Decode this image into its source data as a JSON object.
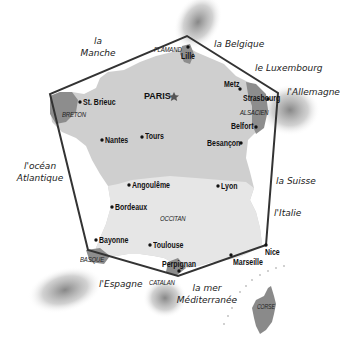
{
  "map": {
    "type": "schematic map of France (hexagon) with neighbors and regional languages",
    "colors": {
      "land": "#cfcfcf",
      "land_south": "#e4e4e4",
      "region_highlight": "#8a8a8a",
      "hexagon_line": "#333333",
      "background": "#ffffff"
    },
    "capital": {
      "name": "PARIS",
      "icon": "star-icon"
    },
    "cities": [
      {
        "name": "Lille"
      },
      {
        "name": "Metz"
      },
      {
        "name": "Strasbourg"
      },
      {
        "name": "St. Brieuc"
      },
      {
        "name": "Belfort"
      },
      {
        "name": "Nantes"
      },
      {
        "name": "Tours"
      },
      {
        "name": "Besançon"
      },
      {
        "name": "Angoulême"
      },
      {
        "name": "Lyon"
      },
      {
        "name": "Bordeaux"
      },
      {
        "name": "Bayonne"
      },
      {
        "name": "Toulouse"
      },
      {
        "name": "Perpignan"
      },
      {
        "name": "Marseille"
      },
      {
        "name": "Nice"
      }
    ],
    "regions": [
      {
        "name": "FLAMAND"
      },
      {
        "name": "BRETON"
      },
      {
        "name": "ALSACIEN"
      },
      {
        "name": "OCCITAN"
      },
      {
        "name": "BASQUE"
      },
      {
        "name": "CATALAN"
      },
      {
        "name": "CORSE"
      }
    ],
    "neighbors": [
      {
        "name": "la Manche",
        "line1": "la",
        "line2": "Manche"
      },
      {
        "name": "la Belgique"
      },
      {
        "name": "le Luxembourg"
      },
      {
        "name": "l'Allemagne"
      },
      {
        "name": "l'océan Atlantique",
        "line1": "l'océan",
        "line2": "Atlantique"
      },
      {
        "name": "la Suisse"
      },
      {
        "name": "l'Italie"
      },
      {
        "name": "l'Espagne"
      },
      {
        "name": "la mer Méditerranée",
        "line1": "la mer",
        "line2": "Méditerranée"
      }
    ]
  }
}
